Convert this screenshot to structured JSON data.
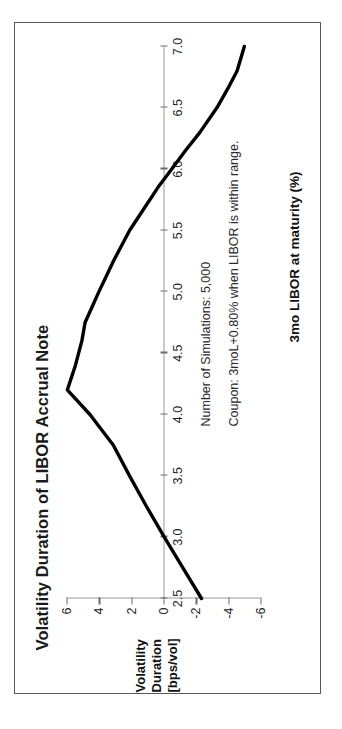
{
  "chart_data": {
    "type": "line",
    "title": "Volatility Duration of LIBOR Accrual Note",
    "xlabel": "3mo LIBOR at maturity (%)",
    "ylabel": "Volatility Duration [bps/vol]",
    "ylabel_lines": [
      "Volatility",
      "Duration",
      "[bps/vol]"
    ],
    "xlim": [
      2.5,
      7.0
    ],
    "ylim": [
      -6,
      6
    ],
    "xticks": [
      2.5,
      3.0,
      3.5,
      4.0,
      4.5,
      5.0,
      5.5,
      6.0,
      6.5,
      7.0
    ],
    "xtick_labels": [
      "2.5",
      "3.0",
      "3.5",
      "4.0",
      "4.5",
      "5.0",
      "5.5",
      "6.0",
      "6.5",
      "7.0"
    ],
    "yticks": [
      6,
      4,
      2,
      0,
      -2,
      -4,
      -6
    ],
    "ytick_labels": [
      "6",
      "4",
      "2",
      "0",
      "-2",
      "-4",
      "-6"
    ],
    "grid": false,
    "legend": null,
    "series": [
      {
        "name": "Volatility Duration",
        "color": "#000000",
        "x": [
          2.5,
          2.75,
          3.0,
          3.25,
          3.5,
          3.75,
          4.0,
          4.2,
          4.4,
          4.6,
          4.75,
          5.0,
          5.25,
          5.5,
          5.7,
          5.85,
          6.0,
          6.15,
          6.3,
          6.5,
          6.65,
          6.8,
          7.0
        ],
        "y": [
          -2.35,
          -1.2,
          -0.05,
          1.05,
          2.1,
          3.1,
          4.55,
          5.95,
          5.45,
          5.05,
          4.85,
          4.0,
          3.1,
          2.1,
          1.1,
          0.35,
          -0.5,
          -1.35,
          -2.25,
          -3.3,
          -3.95,
          -4.55,
          -5.0
        ]
      }
    ],
    "annotations": [
      "Number of Simulations: 5,000",
      "Coupon: 3moL+0.80% when LIBOR is within range."
    ]
  }
}
